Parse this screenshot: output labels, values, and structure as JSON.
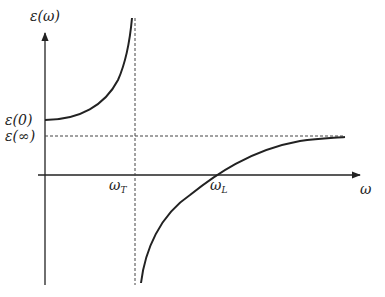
{
  "diagram": {
    "y_axis_label": "ε(ω)",
    "x_axis_label": "ω",
    "y_ticks": [
      {
        "label": "ε(0)",
        "y": 120
      },
      {
        "label": "ε(∞)",
        "y": 136
      }
    ],
    "x_ticks": [
      {
        "label": "ωT",
        "main": "ω",
        "sub": "T",
        "x": 135
      },
      {
        "label": "ωL",
        "main": "ω",
        "sub": "L",
        "x": 215
      }
    ],
    "colors": {
      "curve": "#222222",
      "axis": "#222222",
      "dashed": "#444444"
    }
  },
  "labels": {
    "eps_omega": "ε(ω)",
    "eps_zero": "ε(0)",
    "eps_inf": "ε(∞)",
    "omega": "ω",
    "omega_T_main": "ω",
    "omega_T_sub": "T",
    "omega_L_main": "ω",
    "omega_L_sub": "L"
  }
}
